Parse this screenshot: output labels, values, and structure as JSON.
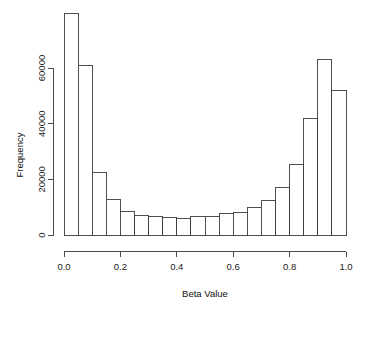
{
  "chart_data": {
    "type": "bar",
    "chart_style": "histogram",
    "title": "",
    "subtitle": "",
    "xlabel": "Beta Value",
    "ylabel": "Frequency",
    "xlim": [
      0.0,
      1.0
    ],
    "ylim": [
      0,
      79500
    ],
    "grid": false,
    "legend": null,
    "legend_position": "none",
    "bin_width": 0.05,
    "bin_count": 20,
    "x_tick_labels": [
      "0.0",
      "0.2",
      "0.4",
      "0.6",
      "0.8",
      "1.0"
    ],
    "x_tick_values": [
      0.0,
      0.2,
      0.4,
      0.6,
      0.8,
      1.0
    ],
    "y_tick_labels": [
      "0",
      "20000",
      "40000",
      "60000"
    ],
    "y_tick_values": [
      0,
      20000,
      40000,
      60000
    ],
    "bin_starts": [
      0.0,
      0.05,
      0.1,
      0.15,
      0.2,
      0.25,
      0.3,
      0.35,
      0.4,
      0.45,
      0.5,
      0.55,
      0.6,
      0.65,
      0.7,
      0.75,
      0.8,
      0.85,
      0.9,
      0.95
    ],
    "bin_ends": [
      0.05,
      0.1,
      0.15,
      0.2,
      0.25,
      0.3,
      0.35,
      0.4,
      0.45,
      0.5,
      0.55,
      0.6,
      0.65,
      0.7,
      0.75,
      0.8,
      0.85,
      0.9,
      0.95,
      1.0
    ],
    "categories": [
      "0.00-0.05",
      "0.05-0.10",
      "0.10-0.15",
      "0.15-0.20",
      "0.20-0.25",
      "0.25-0.30",
      "0.30-0.35",
      "0.35-0.40",
      "0.40-0.45",
      "0.45-0.50",
      "0.50-0.55",
      "0.55-0.60",
      "0.60-0.65",
      "0.65-0.70",
      "0.70-0.75",
      "0.75-0.80",
      "0.80-0.85",
      "0.85-0.90",
      "0.90-0.95",
      "0.95-1.00"
    ],
    "values": [
      79500,
      61000,
      22500,
      12800,
      8300,
      7100,
      6800,
      6200,
      6100,
      6600,
      6800,
      7700,
      8200,
      9800,
      12500,
      17000,
      25500,
      42000,
      63000,
      52000
    ],
    "values_tail": [
      18000
    ],
    "bar_fill": "#ffffff",
    "bar_edge": "#3c3c3c",
    "axis_color": "#4a4a4a",
    "background": "#ffffff"
  },
  "axes": {
    "x_title": "Beta Value",
    "y_title": "Frequency"
  }
}
